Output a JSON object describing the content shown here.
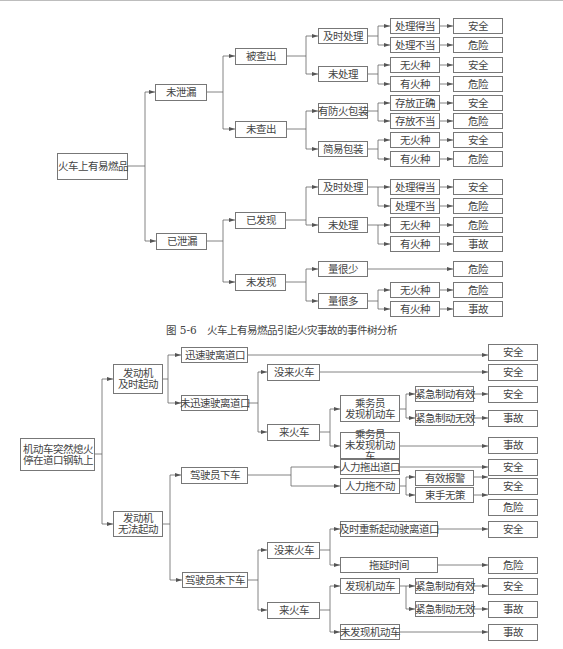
{
  "figure_5_6": {
    "caption": "图 5-6　火车上有易燃品引起火灾事故的事件树分析",
    "root": "火车上有易燃品",
    "level1": [
      "未泄漏",
      "已泄漏"
    ],
    "level2": [
      "被查出",
      "未查出",
      "已发现",
      "未发现"
    ],
    "level3": [
      "及时处理",
      "未处理",
      "有防火包装",
      "简易包装",
      "及时处理",
      "未处理",
      "量很少",
      "量很多"
    ],
    "level4": [
      "处理得当",
      "处理不当",
      "无火种",
      "有火种",
      "存放正确",
      "存放不当",
      "无火种",
      "有火种",
      "处理得当",
      "处理不当",
      "无火种",
      "有火种",
      "无火种",
      "有火种"
    ],
    "outcomes": [
      "安全",
      "危险",
      "安全",
      "危险",
      "安全",
      "危险",
      "安全",
      "危险",
      "安全",
      "危险",
      "危险",
      "事故",
      "危险",
      "危险",
      "事故"
    ]
  },
  "figure_2": {
    "root": [
      "机动车突然熄火",
      "停在道口钢轨上"
    ],
    "engine_started": [
      "发动机",
      "及时起动"
    ],
    "engine_failed": [
      "发动机",
      "无法起动"
    ],
    "fast_leave": "迅速驶离道口",
    "not_fast_leave": "未迅速驶离道口",
    "no_train_a": "没来火车",
    "train_a": "来火车",
    "crew_found": [
      "乘务员",
      "发现机动车"
    ],
    "crew_not_found": [
      "乘务员",
      "未发现机动车"
    ],
    "brake_ok_a": "紧急制动有效",
    "brake_fail_a": "紧急制动无效",
    "driver_out": "驾驶员下车",
    "driver_in": "驾驶员未下车",
    "push_out": "人力拖出道口",
    "push_fail": "人力拖不动",
    "alarm_ok": "有效报警",
    "helpless": "束手无策",
    "no_train_b": "没来火车",
    "train_b": "来火车",
    "restart": "及时重新起动驶离道口",
    "delay": "拖延时间",
    "found_b": "发现机动车",
    "not_found_b": "未发现机动车",
    "brake_ok_b": "紧急制动有效",
    "brake_fail_b": "紧急制动无效",
    "outcomes": [
      "安全",
      "安全",
      "安全",
      "事故",
      "事故",
      "安全",
      "安全",
      "危险",
      "安全",
      "危险",
      "安全",
      "事故",
      "事故"
    ]
  }
}
